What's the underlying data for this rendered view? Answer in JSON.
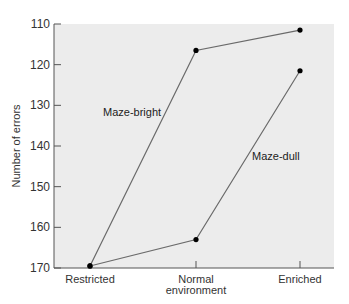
{
  "chart_data": {
    "type": "line",
    "title": "",
    "xlabel": "",
    "ylabel": "Number of errors",
    "categories": [
      "Restricted",
      "Normal environment",
      "Enriched"
    ],
    "category_lines": [
      [
        "Restricted"
      ],
      [
        "Normal",
        "environment"
      ],
      [
        "Enriched"
      ]
    ],
    "ylim": [
      170,
      110
    ],
    "y_inverted": true,
    "yticks": [
      110,
      120,
      130,
      140,
      150,
      160,
      170
    ],
    "grid": false,
    "legend": "none (inline annotations)",
    "series": [
      {
        "name": "Maze-bright",
        "values": [
          169.5,
          116.5,
          111.5
        ]
      },
      {
        "name": "Maze-dull",
        "values": [
          169.5,
          163,
          121.5
        ]
      }
    ],
    "annotations": [
      {
        "text": "Maze-bright",
        "x_px": 103,
        "y_px": 116
      },
      {
        "text": "Maze-dull",
        "x_px": 252,
        "y_px": 160
      }
    ]
  },
  "colors": {
    "plot_background": "#ececec",
    "line": "#6a6a6a",
    "marker": "#000000",
    "axis": "#555555"
  }
}
